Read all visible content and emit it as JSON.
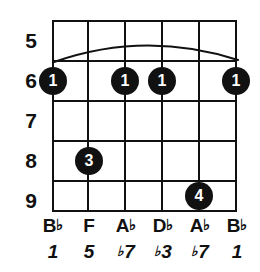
{
  "diagram": {
    "type": "guitar-chord-diagram",
    "title": "",
    "string_count": 6,
    "fret_count": 5,
    "colors": {
      "ink": "#111111",
      "background": "#ffffff",
      "dot_fill": "#111111",
      "dot_text": "#ffffff"
    }
  },
  "fret_numbers": [
    {
      "label": "5"
    },
    {
      "label": "6"
    },
    {
      "label": "7"
    },
    {
      "label": "8"
    },
    {
      "label": "9"
    }
  ],
  "barre": {
    "present": true,
    "fret": "6",
    "from_string": 1,
    "to_string": 6,
    "icon": "barre-arc-icon"
  },
  "dots": [
    {
      "finger": "1",
      "string": 1,
      "fret": "6"
    },
    {
      "finger": "1",
      "string": 3,
      "fret": "6"
    },
    {
      "finger": "1",
      "string": 4,
      "fret": "6"
    },
    {
      "finger": "1",
      "string": 6,
      "fret": "6"
    },
    {
      "finger": "3",
      "string": 2,
      "fret": "8"
    },
    {
      "finger": "4",
      "string": 5,
      "fret": "9"
    }
  ],
  "notes": [
    {
      "letter": "B",
      "accidental": "♭",
      "full": "B♭"
    },
    {
      "letter": "F",
      "accidental": "",
      "full": "F"
    },
    {
      "letter": "A",
      "accidental": "♭",
      "full": "A♭"
    },
    {
      "letter": "D",
      "accidental": "♭",
      "full": "D♭"
    },
    {
      "letter": "A",
      "accidental": "♭",
      "full": "A♭"
    },
    {
      "letter": "B",
      "accidental": "♭",
      "full": "B♭"
    }
  ],
  "intervals": [
    {
      "accidental": "",
      "degree": "1",
      "full": "1"
    },
    {
      "accidental": "",
      "degree": "5",
      "full": "5"
    },
    {
      "accidental": "♭",
      "degree": "7",
      "full": "♭7"
    },
    {
      "accidental": "♭",
      "degree": "3",
      "full": "♭3"
    },
    {
      "accidental": "♭",
      "degree": "7",
      "full": "♭7"
    },
    {
      "accidental": "",
      "degree": "1",
      "full": "1"
    }
  ]
}
